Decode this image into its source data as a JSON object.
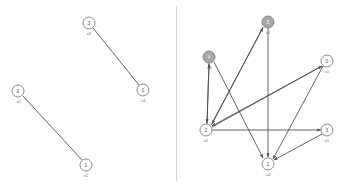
{
  "figure": {
    "background_color": "#ffffff",
    "node_stroke_color": "#8c8c8c",
    "node_fill_white": "#ffffff",
    "node_fill_gray": "#a8a8a8",
    "edge_color": "#4a4a4a",
    "divider_color": "#d8d8d8",
    "node_radius": 6
  },
  "panels": [
    {
      "name": "left-graph",
      "nodes": [
        {
          "id": "3",
          "label": "x2",
          "x": 89,
          "y": 23,
          "fill": "white"
        },
        {
          "id": "0",
          "label": "-x1",
          "x": 143,
          "y": 90,
          "fill": "white"
        },
        {
          "id": "2",
          "label": "-x2",
          "x": 18,
          "y": 91,
          "fill": "white"
        },
        {
          "id": "1",
          "label": "x1",
          "x": 86,
          "y": 165,
          "fill": "white"
        }
      ],
      "edges": [
        {
          "from": "3",
          "to": "0",
          "directed": false
        },
        {
          "from": "2",
          "to": "1",
          "directed": false
        }
      ]
    },
    {
      "name": "right-graph",
      "nodes": [
        {
          "id": "5",
          "label": "x1",
          "x": 91,
          "y": 22,
          "fill": "gray"
        },
        {
          "id": "4",
          "label": "-x1",
          "x": 32,
          "y": 57,
          "fill": "gray"
        },
        {
          "id": "0",
          "label": "x1",
          "x": 150,
          "y": 61,
          "fill": "white"
        },
        {
          "id": "2",
          "label": "x2",
          "x": 29,
          "y": 130,
          "fill": "white"
        },
        {
          "id": "3",
          "label": "x1",
          "x": 150,
          "y": 130,
          "fill": "white"
        },
        {
          "id": "1",
          "label": "-x2",
          "x": 91,
          "y": 164,
          "fill": "white"
        }
      ],
      "edges": [
        {
          "from": "5",
          "to": "2",
          "directed": true
        },
        {
          "from": "5",
          "to": "1",
          "directed": true
        },
        {
          "from": "4",
          "to": "2",
          "directed": true
        },
        {
          "from": "4",
          "to": "1",
          "directed": true
        },
        {
          "from": "0",
          "to": "2",
          "directed": true
        },
        {
          "from": "0",
          "to": "1",
          "directed": true
        },
        {
          "from": "2",
          "to": "4",
          "directed": true
        },
        {
          "from": "2",
          "to": "5",
          "directed": true
        },
        {
          "from": "2",
          "to": "3",
          "directed": true
        },
        {
          "from": "2",
          "to": "0",
          "directed": true
        },
        {
          "from": "3",
          "to": "1",
          "directed": true
        }
      ]
    }
  ]
}
